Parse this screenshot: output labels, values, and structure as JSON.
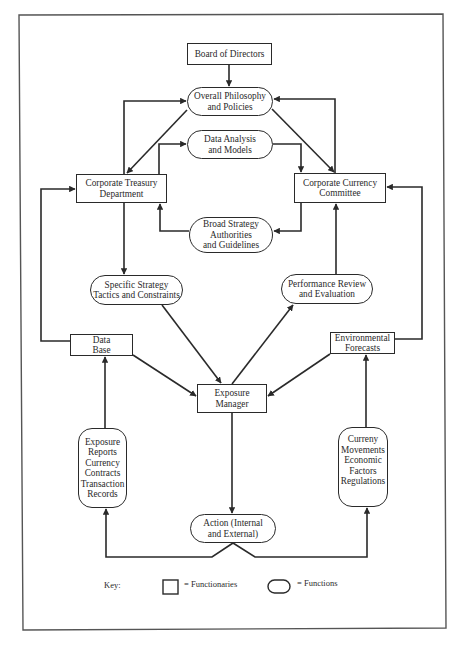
{
  "diagram": {
    "nodes": {
      "board": {
        "type": "functionary",
        "lines": [
          "Board of Directors"
        ]
      },
      "philosophy": {
        "type": "function",
        "lines": [
          "Overall Philosophy",
          "and Policies"
        ]
      },
      "data_analysis": {
        "type": "function",
        "lines": [
          "Data Analysis",
          "and Models"
        ]
      },
      "treasury": {
        "type": "functionary",
        "lines": [
          "Corporate Treasury",
          "Department"
        ]
      },
      "currency_committee": {
        "type": "functionary",
        "lines": [
          "Corporate Currency",
          "Committee"
        ]
      },
      "broad_strategy": {
        "type": "function",
        "lines": [
          "Broad Strategy",
          "Authorities",
          "and Guidelines"
        ]
      },
      "specific_strategy": {
        "type": "function",
        "lines": [
          "Specific Strategy",
          "Tactics and Constraints"
        ]
      },
      "performance_review": {
        "type": "function",
        "lines": [
          "Performance Review",
          "and Evaluation"
        ]
      },
      "data_base": {
        "type": "functionary",
        "lines": [
          "Data",
          "Base"
        ]
      },
      "environmental_forecasts": {
        "type": "functionary",
        "lines": [
          "Environmental",
          "Forecasts"
        ]
      },
      "exposure_manager": {
        "type": "functionary",
        "lines": [
          "Exposure",
          "Manager"
        ]
      },
      "exposure_reports": {
        "type": "function",
        "lines": [
          "Exposure",
          "Reports",
          "Currency",
          "Contracts",
          "Transaction",
          "Records"
        ]
      },
      "currency_movements": {
        "type": "function",
        "lines": [
          "Curreny",
          "Movements",
          "Economic",
          "Factors",
          "Regulations"
        ]
      },
      "action": {
        "type": "function",
        "lines": [
          "Action (Internal",
          "and External)"
        ]
      }
    },
    "edges": [
      {
        "from": "Board of Directors",
        "to": "Overall Philosophy and Policies"
      },
      {
        "from": "Corporate Treasury Department",
        "to": "Overall Philosophy and Policies"
      },
      {
        "from": "Overall Philosophy and Policies",
        "to": "Corporate Treasury Department"
      },
      {
        "from": "Corporate Currency Committee",
        "to": "Overall Philosophy and Policies"
      },
      {
        "from": "Overall Philosophy and Policies",
        "to": "Corporate Currency Committee"
      },
      {
        "from": "Corporate Treasury Department",
        "to": "Data Analysis and Models"
      },
      {
        "from": "Data Analysis and Models",
        "to": "Corporate Currency Committee"
      },
      {
        "from": "Corporate Currency Committee",
        "to": "Broad Strategy Authorities and Guidelines"
      },
      {
        "from": "Broad Strategy Authorities and Guidelines",
        "to": "Corporate Treasury Department"
      },
      {
        "from": "Corporate Treasury Department",
        "to": "Specific Strategy Tactics and Constraints"
      },
      {
        "from": "Performance Review and Evaluation",
        "to": "Corporate Currency Committee"
      },
      {
        "from": "Data Base",
        "to": "Corporate Treasury Department"
      },
      {
        "from": "Environmental Forecasts",
        "to": "Corporate Currency Committee"
      },
      {
        "from": "Specific Strategy Tactics and Constraints",
        "to": "Exposure Manager"
      },
      {
        "from": "Exposure Manager",
        "to": "Performance Review and Evaluation"
      },
      {
        "from": "Data Base",
        "to": "Exposure Manager"
      },
      {
        "from": "Environmental Forecasts",
        "to": "Exposure Manager"
      },
      {
        "from": "Exposure Manager",
        "to": "Action (Internal and External)"
      },
      {
        "from": "Action (Internal and External)",
        "to": "Exposure Reports / Currency Contracts / Transaction Records"
      },
      {
        "from": "Action (Internal and External)",
        "to": "Curreny Movements / Economic Factors / Regulations"
      },
      {
        "from": "Exposure Reports / Currency Contracts / Transaction Records",
        "to": "Data Base"
      },
      {
        "from": "Curreny Movements / Economic Factors / Regulations",
        "to": "Environmental Forecasts"
      }
    ]
  },
  "key": {
    "label": "Key:",
    "functionaries": "= Functionaries",
    "functions": "= Functions"
  },
  "colors": {
    "line": "#2a2a2a",
    "background": "#ffffff"
  }
}
